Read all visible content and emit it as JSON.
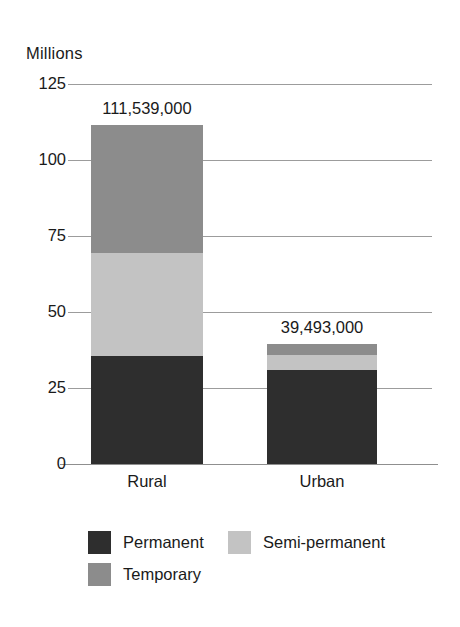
{
  "chart_data": {
    "type": "bar",
    "subtype": "stacked-bar",
    "title": "",
    "subtitle": "",
    "xlabel": "",
    "ylabel": "Millions",
    "categories": [
      "Rural",
      "Urban"
    ],
    "series": [
      {
        "name": "Permanent",
        "color": "#2e2e2e",
        "values": [
          35.5,
          31.0
        ]
      },
      {
        "name": "Semi-permanent",
        "color": "#c3c3c3",
        "values": [
          34.0,
          5.0
        ]
      },
      {
        "name": "Temporary",
        "color": "#8c8c8c",
        "values": [
          42.0,
          3.5
        ]
      }
    ],
    "stack_order_bottom_to_top": [
      "Permanent",
      "Semi-permanent",
      "Temporary"
    ],
    "totals": [
      111.539,
      39.493
    ],
    "total_labels": [
      "111,539,000",
      "39,493,000"
    ],
    "ylim": [
      0,
      125
    ],
    "yticks": [
      0,
      25,
      50,
      75,
      100,
      125
    ],
    "ytick_labels": [
      "0",
      "25",
      "50",
      "75",
      "100",
      "125"
    ],
    "grid": true,
    "grid_axis": "y",
    "legend_position": "bottom-left",
    "units": "Millions"
  },
  "axis": {
    "y_title": "Millions",
    "ticks": [
      {
        "label": "125"
      },
      {
        "label": "100"
      },
      {
        "label": "75"
      },
      {
        "label": "50"
      },
      {
        "label": "25"
      },
      {
        "label": "0"
      }
    ]
  },
  "bars": [
    {
      "category": "Rural",
      "total_label": "111,539,000"
    },
    {
      "category": "Urban",
      "total_label": "39,493,000"
    }
  ],
  "legend": {
    "items": [
      {
        "label": "Permanent"
      },
      {
        "label": "Semi-permanent"
      },
      {
        "label": "Temporary"
      }
    ]
  }
}
